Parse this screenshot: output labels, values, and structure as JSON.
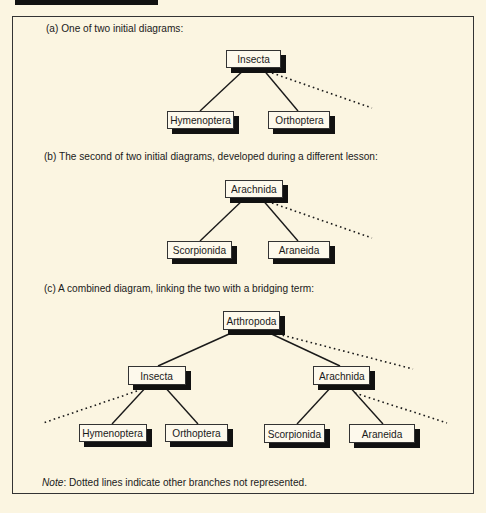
{
  "captions": {
    "a": "(a)  One of two initial diagrams:",
    "b": "(b)  The second of two initial diagrams, developed during a different lesson:",
    "c": "(c)  A combined diagram, linking the two with a bridging term:"
  },
  "diagram_a": {
    "root": "Insecta",
    "children": [
      "Hymenoptera",
      "Orthoptera"
    ]
  },
  "diagram_b": {
    "root": "Arachnida",
    "children": [
      "Scorpionida",
      "Araneida"
    ]
  },
  "diagram_c": {
    "root": "Arthropoda",
    "left": {
      "label": "Insecta",
      "children": [
        "Hymenoptera",
        "Orthoptera"
      ]
    },
    "right": {
      "label": "Arachnida",
      "children": [
        "Scorpionida",
        "Araneida"
      ]
    }
  },
  "note": {
    "label": "Note",
    "text": ":  Dotted lines indicate other branches not represented."
  },
  "colors": {
    "background": "#fbf5e1",
    "box_fill": "#fdf9ec",
    "line": "#1a1a1a",
    "shadow": "#111111"
  }
}
